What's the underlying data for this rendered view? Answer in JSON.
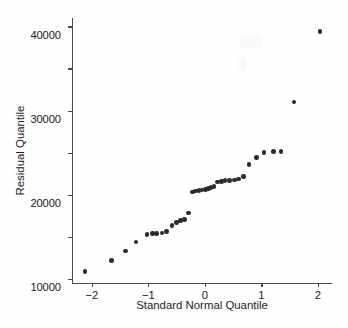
{
  "chart_data": {
    "type": "scatter",
    "title": "",
    "xlabel": "Standard Normal Quantile",
    "ylabel": "Residual Quantile",
    "xlim": [
      -2.35,
      2.25
    ],
    "ylim": [
      -21000,
      42000
    ],
    "xticks": [
      -2,
      -1,
      0,
      1,
      2
    ],
    "xtick_labels": [
      "−2",
      "−1",
      "0",
      "1",
      "2"
    ],
    "yticks": [
      -20000,
      -10000,
      0,
      10000,
      20000,
      30000,
      40000
    ],
    "ytick_labels": [
      "−20000",
      "−10000",
      "0",
      "10000",
      "20000",
      "30000",
      "40000"
    ],
    "grid": false,
    "legend": null,
    "marker": "filled-circle",
    "marker_color": "#2b2b2b",
    "axis_color": "#4a4a4a",
    "background_color": "#fefefe",
    "series": [
      {
        "name": "residual-quantiles",
        "x": [
          -2.12,
          -1.65,
          -1.4,
          -1.22,
          -1.02,
          -0.93,
          -0.85,
          -0.76,
          -0.68,
          -0.58,
          -0.5,
          -0.43,
          -0.36,
          -0.29,
          -0.22,
          -0.16,
          -0.1,
          -0.05,
          0.01,
          0.06,
          0.11,
          0.16,
          0.22,
          0.29,
          0.36,
          0.44,
          0.52,
          0.6,
          0.68,
          0.78,
          0.91,
          1.05,
          1.22,
          1.35,
          1.58,
          2.04
        ],
        "y": [
          -18200,
          -15700,
          -13400,
          -11300,
          -9500,
          -9300,
          -9200,
          -9100,
          -8800,
          -7400,
          -6600,
          -6200,
          -5900,
          -4400,
          600,
          900,
          1000,
          1100,
          1200,
          1400,
          1700,
          2000,
          3000,
          3200,
          3300,
          3400,
          3500,
          3700,
          4300,
          7200,
          8800,
          10000,
          10300,
          10300,
          22000,
          38800
        ]
      }
    ]
  }
}
